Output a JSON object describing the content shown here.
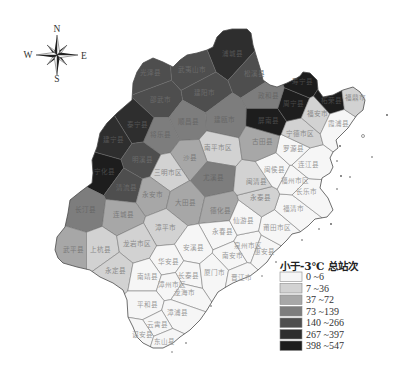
{
  "compass": {
    "n": "N",
    "s": "S",
    "e": "E",
    "w": "W"
  },
  "legend": {
    "title": "小于-3℃ 总站次",
    "classes": [
      {
        "label": "0 ~6",
        "min": 0,
        "max": 6,
        "color": "#f6f6f6",
        "label_color": "#9a9a9a"
      },
      {
        "label": "7 ~36",
        "min": 7,
        "max": 36,
        "color": "#d2d2d2",
        "label_color": "#8a8a8a"
      },
      {
        "label": "37 ~72",
        "min": 37,
        "max": 72,
        "color": "#a7a7a7",
        "label_color": "#7a7a7a"
      },
      {
        "label": "73 ~139",
        "min": 73,
        "max": 139,
        "color": "#7d7d7d",
        "label_color": "#666666"
      },
      {
        "label": "140 ~266",
        "min": 140,
        "max": 266,
        "color": "#4e4e4e",
        "label_color": "#6a6a6a"
      },
      {
        "label": "267 ~397",
        "min": 267,
        "max": 397,
        "color": "#2e2e2e",
        "label_color": "#555555"
      },
      {
        "label": "398 ~547",
        "min": 398,
        "max": 547,
        "color": "#1d1d1d",
        "label_color": "#484848"
      }
    ]
  },
  "map": {
    "outline": [
      [
        223,
        31
      ],
      [
        232,
        29
      ],
      [
        247,
        29
      ],
      [
        251,
        33
      ],
      [
        253,
        45
      ],
      [
        256,
        55
      ],
      [
        260,
        68
      ],
      [
        263,
        80
      ],
      [
        270,
        85
      ],
      [
        277,
        87
      ],
      [
        287,
        83
      ],
      [
        295,
        79
      ],
      [
        300,
        76
      ],
      [
        303,
        72
      ],
      [
        310,
        73
      ],
      [
        317,
        80
      ],
      [
        318,
        90
      ],
      [
        323,
        97
      ],
      [
        333,
        95
      ],
      [
        343,
        90
      ],
      [
        353,
        87
      ],
      [
        360,
        92
      ],
      [
        365,
        100
      ],
      [
        363,
        110
      ],
      [
        357,
        115
      ],
      [
        352,
        122
      ],
      [
        348,
        128
      ],
      [
        343,
        133
      ],
      [
        336,
        140
      ],
      [
        338,
        148
      ],
      [
        333,
        152
      ],
      [
        330,
        158
      ],
      [
        333,
        167
      ],
      [
        330,
        173
      ],
      [
        322,
        178
      ],
      [
        320,
        188
      ],
      [
        328,
        198
      ],
      [
        333,
        210
      ],
      [
        327,
        217
      ],
      [
        315,
        219
      ],
      [
        308,
        226
      ],
      [
        300,
        232
      ],
      [
        292,
        234
      ],
      [
        287,
        240
      ],
      [
        280,
        247
      ],
      [
        273,
        253
      ],
      [
        267,
        262
      ],
      [
        258,
        270
      ],
      [
        250,
        276
      ],
      [
        240,
        280
      ],
      [
        233,
        283
      ],
      [
        226,
        287
      ],
      [
        218,
        292
      ],
      [
        213,
        300
      ],
      [
        207,
        310
      ],
      [
        200,
        320
      ],
      [
        190,
        330
      ],
      [
        180,
        337
      ],
      [
        173,
        343
      ],
      [
        163,
        348
      ],
      [
        153,
        348
      ],
      [
        143,
        343
      ],
      [
        137,
        337
      ],
      [
        133,
        327
      ],
      [
        128,
        317
      ],
      [
        127,
        300
      ],
      [
        123,
        290
      ],
      [
        113,
        283
      ],
      [
        100,
        277
      ],
      [
        90,
        270
      ],
      [
        77,
        267
      ],
      [
        63,
        263
      ],
      [
        58,
        258
      ],
      [
        55,
        250
      ],
      [
        57,
        237
      ],
      [
        65,
        227
      ],
      [
        68,
        213
      ],
      [
        70,
        200
      ],
      [
        80,
        192
      ],
      [
        92,
        183
      ],
      [
        93,
        173
      ],
      [
        92,
        160
      ],
      [
        97,
        147
      ],
      [
        100,
        133
      ],
      [
        107,
        123
      ],
      [
        117,
        113
      ],
      [
        132,
        100
      ],
      [
        133,
        83
      ],
      [
        137,
        72
      ],
      [
        143,
        63
      ],
      [
        153,
        58
      ],
      [
        163,
        62
      ],
      [
        173,
        67
      ],
      [
        180,
        60
      ],
      [
        187,
        55
      ],
      [
        197,
        53
      ],
      [
        207,
        50
      ],
      [
        213,
        47
      ],
      [
        217,
        37
      ]
    ],
    "regions": [
      {
        "name": "浦城县",
        "x": 232,
        "y": 54,
        "class": 5
      },
      {
        "name": "光泽县",
        "x": 150,
        "y": 73,
        "class": 4
      },
      {
        "name": "武夷山市",
        "x": 192,
        "y": 70,
        "class": 4
      },
      {
        "name": "松溪县",
        "x": 254,
        "y": 74,
        "class": 4
      },
      {
        "name": "政和县",
        "x": 268,
        "y": 96,
        "class": 3
      },
      {
        "name": "建阳市",
        "x": 204,
        "y": 93,
        "class": 4
      },
      {
        "name": "邵武市",
        "x": 160,
        "y": 100,
        "class": 4
      },
      {
        "name": "建瓯市",
        "x": 224,
        "y": 120,
        "class": 3
      },
      {
        "name": "顺昌县",
        "x": 188,
        "y": 122,
        "class": 3
      },
      {
        "name": "将乐县",
        "x": 160,
        "y": 135,
        "class": 3
      },
      {
        "name": "泰宁县",
        "x": 137,
        "y": 125,
        "class": 5
      },
      {
        "name": "建宁县",
        "x": 113,
        "y": 140,
        "class": 5
      },
      {
        "name": "南平市区",
        "x": 218,
        "y": 148,
        "class": 1
      },
      {
        "name": "沙县",
        "x": 190,
        "y": 158,
        "class": 2
      },
      {
        "name": "明溪县",
        "x": 142,
        "y": 160,
        "class": 4
      },
      {
        "name": "宁化县",
        "x": 104,
        "y": 172,
        "class": 6
      },
      {
        "name": "清流县",
        "x": 126,
        "y": 188,
        "class": 4
      },
      {
        "name": "三明市区",
        "x": 168,
        "y": 173,
        "class": 1
      },
      {
        "name": "尤溪县",
        "x": 213,
        "y": 178,
        "class": 3
      },
      {
        "name": "永安市",
        "x": 152,
        "y": 195,
        "class": 2
      },
      {
        "name": "长汀县",
        "x": 85,
        "y": 210,
        "class": 3
      },
      {
        "name": "连城县",
        "x": 123,
        "y": 215,
        "class": 2
      },
      {
        "name": "大田县",
        "x": 185,
        "y": 203,
        "class": 2
      },
      {
        "name": "德化县",
        "x": 220,
        "y": 211,
        "class": 2
      },
      {
        "name": "漳平市",
        "x": 165,
        "y": 228,
        "class": 1
      },
      {
        "name": "永春县",
        "x": 222,
        "y": 232,
        "class": 0
      },
      {
        "name": "武平县",
        "x": 73,
        "y": 250,
        "class": 2
      },
      {
        "name": "上杭县",
        "x": 100,
        "y": 250,
        "class": 1
      },
      {
        "name": "龙岩市区",
        "x": 137,
        "y": 244,
        "class": 1
      },
      {
        "name": "永定县",
        "x": 115,
        "y": 271,
        "class": 1
      },
      {
        "name": "安溪县",
        "x": 193,
        "y": 248,
        "class": 0
      },
      {
        "name": "华安县",
        "x": 168,
        "y": 262,
        "class": 0
      },
      {
        "name": "南安市",
        "x": 232,
        "y": 256,
        "class": 0
      },
      {
        "name": "泉州市区",
        "x": 248,
        "y": 246,
        "class": 0
      },
      {
        "name": "惠安县",
        "x": 264,
        "y": 252,
        "class": 0
      },
      {
        "name": "南靖县",
        "x": 147,
        "y": 277,
        "class": 0
      },
      {
        "name": "长泰县",
        "x": 188,
        "y": 276,
        "class": 0
      },
      {
        "name": "厦门市",
        "x": 214,
        "y": 273,
        "class": 0
      },
      {
        "name": "晋江市",
        "x": 241,
        "y": 278,
        "class": 0
      },
      {
        "name": "漳州市区",
        "x": 172,
        "y": 285,
        "class": 0
      },
      {
        "name": "龙海市",
        "x": 184,
        "y": 293,
        "class": 0
      },
      {
        "name": "平和县",
        "x": 147,
        "y": 305,
        "class": 0
      },
      {
        "name": "漳浦县",
        "x": 177,
        "y": 313,
        "class": 0
      },
      {
        "name": "云霄县",
        "x": 157,
        "y": 325,
        "class": 0
      },
      {
        "name": "诏安县",
        "x": 142,
        "y": 335,
        "class": 0
      },
      {
        "name": "东山县",
        "x": 164,
        "y": 342,
        "class": 0
      },
      {
        "name": "仙游县",
        "x": 243,
        "y": 221,
        "class": 0
      },
      {
        "name": "莆田市区",
        "x": 277,
        "y": 228,
        "class": 0
      },
      {
        "name": "福清市",
        "x": 293,
        "y": 209,
        "class": 0
      },
      {
        "name": "永泰县",
        "x": 260,
        "y": 198,
        "class": 1
      },
      {
        "name": "闽清县",
        "x": 256,
        "y": 182,
        "class": 1
      },
      {
        "name": "闽侯县",
        "x": 274,
        "y": 170,
        "class": 0
      },
      {
        "name": "福州市区",
        "x": 295,
        "y": 181,
        "class": 0
      },
      {
        "name": "长乐市",
        "x": 306,
        "y": 192,
        "class": 0
      },
      {
        "name": "连江县",
        "x": 308,
        "y": 165,
        "class": 0
      },
      {
        "name": "罗源县",
        "x": 293,
        "y": 149,
        "class": 0
      },
      {
        "name": "古田县",
        "x": 262,
        "y": 142,
        "class": 2
      },
      {
        "name": "屏南县",
        "x": 268,
        "y": 121,
        "class": 6
      },
      {
        "name": "宁德市区",
        "x": 300,
        "y": 134,
        "class": 1
      },
      {
        "name": "周宁县",
        "x": 293,
        "y": 104,
        "class": 6
      },
      {
        "name": "寿宁县",
        "x": 302,
        "y": 82,
        "class": 6
      },
      {
        "name": "福安市",
        "x": 317,
        "y": 114,
        "class": 1
      },
      {
        "name": "柘荣县",
        "x": 331,
        "y": 101,
        "class": 6
      },
      {
        "name": "霞浦县",
        "x": 338,
        "y": 124,
        "class": 0
      },
      {
        "name": "福鼎市",
        "x": 355,
        "y": 98,
        "class": 1
      }
    ],
    "islands": [
      [
        387,
        115,
        0.9,
        "dot"
      ],
      [
        363,
        136,
        1.5,
        "ring"
      ],
      [
        372,
        157,
        0.8,
        "dot"
      ],
      [
        350,
        177,
        0.8,
        "dot"
      ],
      [
        340,
        146,
        0.9,
        "dot"
      ],
      [
        337,
        161,
        0.8,
        "dot"
      ],
      [
        341,
        176,
        0.9,
        "dot"
      ],
      [
        337,
        189,
        0.8,
        "dot"
      ],
      [
        331,
        224,
        0.9,
        "dot"
      ],
      [
        319,
        229,
        0.8,
        "dot"
      ],
      [
        302,
        240,
        0.8,
        "dot"
      ],
      [
        276,
        262,
        0.8,
        "dot"
      ],
      [
        262,
        276,
        0.7,
        "dot"
      ],
      [
        211,
        306,
        0.8,
        "dot"
      ],
      [
        186,
        343,
        0.8,
        "dot"
      ],
      [
        172,
        352,
        0.7,
        "dot"
      ]
    ]
  }
}
